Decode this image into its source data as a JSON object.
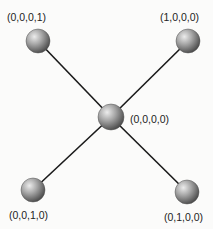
{
  "diagram": {
    "type": "graph",
    "layout": "star",
    "center_node": "n0",
    "nodes": [
      {
        "id": "n0",
        "label": "(0,0,0,0)",
        "x": 111,
        "y": 117,
        "r": 13
      },
      {
        "id": "n1",
        "label": "(0,0,0,1)",
        "x": 38,
        "y": 41,
        "r": 12
      },
      {
        "id": "n2",
        "label": "(1,0,0,0)",
        "x": 188,
        "y": 41,
        "r": 12
      },
      {
        "id": "n3",
        "label": "(0,0,1,0)",
        "x": 33,
        "y": 190,
        "r": 12
      },
      {
        "id": "n4",
        "label": "(0,1,0,0)",
        "x": 187,
        "y": 192,
        "r": 12
      }
    ],
    "edges": [
      {
        "from": "n0",
        "to": "n1"
      },
      {
        "from": "n0",
        "to": "n2"
      },
      {
        "from": "n0",
        "to": "n3"
      },
      {
        "from": "n0",
        "to": "n4"
      }
    ],
    "colors": {
      "background": "#fbfbfa",
      "edge": "#1a1a1a",
      "node_highlight": "#e8e8e8",
      "node_mid": "#9a9a9a",
      "node_shadow": "#4a4a4a",
      "label": "#222222"
    }
  }
}
